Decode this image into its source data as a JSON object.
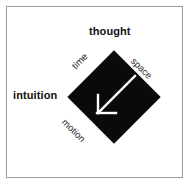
{
  "figure": {
    "background_color": "#ffffff",
    "frame_color": "#9a9a9a",
    "shape": {
      "name": "diamond",
      "fill_color": "#0a0a0a",
      "rotation_degrees": 45
    },
    "arrow": {
      "name": "southwest-arrow",
      "color": "#ffffff",
      "direction": "down-left"
    },
    "labels": {
      "top": "thought",
      "left": "intuition",
      "upper_left_edge": "time",
      "upper_right_edge": "space",
      "lower_left_edge": "motion"
    }
  }
}
